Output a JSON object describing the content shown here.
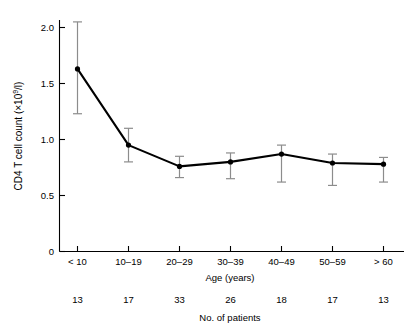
{
  "chart_data": {
    "type": "line",
    "title": "",
    "xlabel": "Age (years)",
    "ylabel": "CD4 T cell count (×10⁹/l)",
    "ylabel_main": "CD4 T cell count (×10",
    "ylabel_exponent": "9",
    "ylabel_tail": "/l)",
    "categories": [
      "< 10",
      "10–19",
      "20–29",
      "30–39",
      "40–49",
      "50–59",
      "> 60"
    ],
    "values": [
      1.63,
      0.95,
      0.76,
      0.8,
      0.87,
      0.79,
      0.78
    ],
    "error_low": [
      1.23,
      0.8,
      0.66,
      0.65,
      0.62,
      0.59,
      0.62
    ],
    "error_high": [
      2.05,
      1.1,
      0.85,
      0.88,
      0.95,
      0.87,
      0.84
    ],
    "ylim": [
      0,
      2.2
    ],
    "yticks": [
      0,
      0.5,
      1.0,
      1.5,
      2.0
    ],
    "ytick_labels": [
      "0",
      "0.5",
      "1.0",
      "1.5",
      "2.0"
    ],
    "grid": false,
    "legend": "none",
    "marker": "filled-circle",
    "line_color": "#000000",
    "error_bar_color": "#8c8c8c",
    "secondary_axis_label": "No. of patients",
    "patient_counts": [
      "13",
      "17",
      "33",
      "26",
      "18",
      "17",
      "13"
    ]
  }
}
